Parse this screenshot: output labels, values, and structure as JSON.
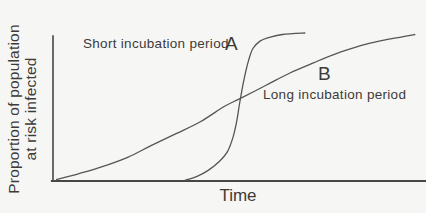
{
  "figure": {
    "background": "#f6f6f4",
    "ink": "#3d3b38",
    "axis_color": "#474745",
    "curve_color": "#57554f"
  },
  "chart_data": {
    "type": "line",
    "title": "",
    "xlabel": "Time",
    "ylabel": "Proportion of population at risk infected",
    "ylabel_lines": [
      "Proportion of population",
      "at risk infected"
    ],
    "grid": false,
    "legend_position": "inline-annotations",
    "x_axis": {
      "ticks": [],
      "range_normalized": [
        0,
        1
      ]
    },
    "y_axis": {
      "ticks": [],
      "range_normalized": [
        0,
        1
      ]
    },
    "series": [
      {
        "id": "A",
        "name": "Short incubation period",
        "annotation_letter": "A",
        "shape": "steep sigmoid (fast epidemic)",
        "x": [
          0.354,
          0.385,
          0.415,
          0.445,
          0.468,
          0.483,
          0.493,
          0.5,
          0.507,
          0.515,
          0.525,
          0.536,
          0.555,
          0.58,
          0.615,
          0.675
        ],
        "y": [
          0.005,
          0.03,
          0.07,
          0.13,
          0.2,
          0.3,
          0.41,
          0.52,
          0.62,
          0.72,
          0.82,
          0.895,
          0.945,
          0.97,
          0.99,
          1.0
        ]
      },
      {
        "id": "B",
        "name": "Long incubation period",
        "annotation_letter": "B",
        "shape": "gradual sigmoid (slow epidemic)",
        "x": [
          0.01,
          0.07,
          0.13,
          0.2,
          0.26,
          0.33,
          0.395,
          0.46,
          0.5,
          0.57,
          0.635,
          0.7,
          0.77,
          0.84,
          0.905,
          0.97
        ],
        "y": [
          0.01,
          0.05,
          0.095,
          0.16,
          0.235,
          0.32,
          0.4,
          0.505,
          0.555,
          0.645,
          0.73,
          0.8,
          0.87,
          0.925,
          0.96,
          0.99
        ]
      }
    ]
  }
}
